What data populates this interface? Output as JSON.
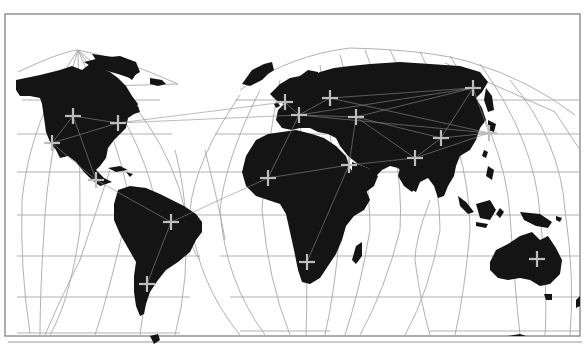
{
  "map": {
    "title": "",
    "projection": "interrupted-homolosine",
    "colors": {
      "land": "#141414",
      "ocean": "#ffffff",
      "graticule": "#a8a8a8",
      "route": "#8c8c8c",
      "marker": "#bdbdbd",
      "frame": "#8a8a8a"
    },
    "markers": [
      {
        "id": "na-1",
        "region": "North America",
        "icon": "plus-icon"
      },
      {
        "id": "na-2",
        "region": "North America",
        "icon": "plus-icon"
      },
      {
        "id": "na-3",
        "region": "North America",
        "icon": "plus-icon"
      },
      {
        "id": "ca-1",
        "region": "Central America",
        "icon": "plus-icon"
      },
      {
        "id": "sa-1",
        "region": "South America",
        "icon": "plus-icon"
      },
      {
        "id": "sa-2",
        "region": "South America",
        "icon": "plus-icon"
      },
      {
        "id": "eu-1",
        "region": "Europe",
        "icon": "plus-icon"
      },
      {
        "id": "eu-2",
        "region": "Europe",
        "icon": "plus-icon"
      },
      {
        "id": "eu-3",
        "region": "Europe",
        "icon": "plus-icon"
      },
      {
        "id": "eu-4",
        "region": "Europe",
        "icon": "plus-icon"
      },
      {
        "id": "af-1",
        "region": "Africa",
        "icon": "plus-icon"
      },
      {
        "id": "af-2",
        "region": "Middle East",
        "icon": "plus-icon"
      },
      {
        "id": "af-3",
        "region": "Africa",
        "icon": "plus-icon"
      },
      {
        "id": "as-1",
        "region": "Asia",
        "icon": "plus-icon"
      },
      {
        "id": "as-2",
        "region": "Asia",
        "icon": "plus-icon"
      },
      {
        "id": "as-3",
        "region": "Asia",
        "icon": "plus-icon"
      },
      {
        "id": "as-4",
        "region": "Asia",
        "icon": "plus-icon"
      },
      {
        "id": "au-1",
        "region": "Australia",
        "icon": "plus-icon"
      }
    ],
    "routes": [
      [
        "na-1",
        "na-2"
      ],
      [
        "na-1",
        "na-3"
      ],
      [
        "na-2",
        "na-3"
      ],
      [
        "na-1",
        "ca-1"
      ],
      [
        "na-3",
        "ca-1"
      ],
      [
        "na-2",
        "eu-2"
      ],
      [
        "na-2",
        "eu-1"
      ],
      [
        "ca-1",
        "sa-1"
      ],
      [
        "sa-1",
        "sa-2"
      ],
      [
        "sa-1",
        "af-1"
      ],
      [
        "eu-1",
        "eu-2"
      ],
      [
        "eu-2",
        "eu-3"
      ],
      [
        "eu-2",
        "eu-4"
      ],
      [
        "eu-3",
        "as-3"
      ],
      [
        "eu-4",
        "as-3"
      ],
      [
        "eu-2",
        "as-3"
      ],
      [
        "eu-4",
        "as-2"
      ],
      [
        "eu-4",
        "as-1"
      ],
      [
        "eu-2",
        "af-1"
      ],
      [
        "eu-4",
        "af-2"
      ],
      [
        "af-1",
        "af-2"
      ],
      [
        "af-2",
        "af-3"
      ],
      [
        "af-2",
        "as-1"
      ],
      [
        "as-1",
        "as-2"
      ],
      [
        "as-2",
        "as-3"
      ],
      [
        "as-2",
        "as-4"
      ],
      [
        "as-3",
        "as-4"
      ],
      [
        "as-1",
        "as-4"
      ],
      [
        "eu-2",
        "as-4"
      ],
      [
        "eu-3",
        "as-4"
      ]
    ]
  }
}
